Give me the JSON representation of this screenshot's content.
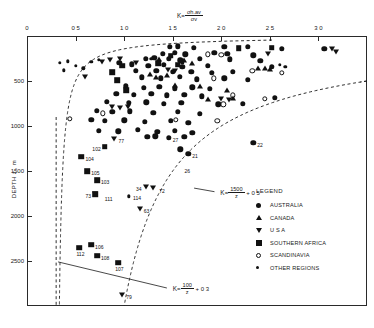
{
  "chart_data": {
    "type": "scatter",
    "title": "",
    "xlabel": "K = sigma_h,av / sigma_v",
    "xlabel_parts": {
      "k": "K",
      "sub": "",
      "num": "σₕ.ₐᵥ",
      "den": "σᵥ"
    },
    "ylabel": "DEPTH z , m",
    "xlim": [
      0,
      3.5
    ],
    "ylim": [
      0,
      3000
    ],
    "y_inverted": true,
    "xticks": [
      0,
      0.5,
      1.0,
      1.5,
      2.0,
      2.5,
      3.0
    ],
    "xticklabels": [
      "0",
      "0 5",
      "1 0",
      "1 5",
      "2 0",
      "2 5",
      "3 0"
    ],
    "yticks": [
      500,
      1000,
      1500,
      2000,
      2500
    ],
    "yticklabels": [
      "500",
      "1000",
      "1500",
      "2000",
      "2500"
    ],
    "grid": false,
    "legend_position": "right-center",
    "annotations": [
      {
        "id": "upper-bound-eq",
        "text": "K = 1500/z + 0.5",
        "k_symbol": "K",
        "numerator": "1500",
        "denominator": "z",
        "constant": "+ 0 5",
        "x": 1.97,
        "y": 1740
      },
      {
        "id": "lower-bound-eq",
        "text": "K = 100/z + 0.3",
        "k_symbol": "K",
        "numerator": "100",
        "denominator": "z",
        "constant": "+ 0 3",
        "x": 1.48,
        "y": 2810
      }
    ],
    "bound_curves": [
      {
        "name": "lower-bound",
        "equation": "K = 100/z + 0.3",
        "style": "dashed",
        "asymptote_k": 0.3
      },
      {
        "name": "upper-bound",
        "equation": "K = 1500/z + 0.5",
        "style": "dashed",
        "asymptote_k": 0.5
      }
    ],
    "series": [
      {
        "name": "AUSTRALIA",
        "symbol": "filled-circle",
        "color": "#111111",
        "points": [
          [
            1.47,
            120
          ],
          [
            1.55,
            115
          ],
          [
            1.72,
            130
          ],
          [
            2.03,
            120
          ],
          [
            2.27,
            120
          ],
          [
            2.62,
            145
          ],
          [
            3.06,
            140
          ],
          [
            1.4,
            200
          ],
          [
            1.52,
            190
          ],
          [
            1.63,
            205
          ],
          [
            1.93,
            185
          ],
          [
            2.06,
            195
          ],
          [
            2.33,
            215
          ],
          [
            1.22,
            250
          ],
          [
            1.31,
            245
          ],
          [
            1.46,
            255
          ],
          [
            1.58,
            270
          ],
          [
            1.78,
            250
          ],
          [
            2.09,
            260
          ],
          [
            2.4,
            275
          ],
          [
            0.95,
            300
          ],
          [
            1.08,
            315
          ],
          [
            1.25,
            330
          ],
          [
            1.41,
            320
          ],
          [
            1.6,
            340
          ],
          [
            1.86,
            330
          ],
          [
            2.52,
            345
          ],
          [
            1.12,
            390
          ],
          [
            1.33,
            385
          ],
          [
            1.5,
            400
          ],
          [
            1.69,
            395
          ],
          [
            1.9,
            410
          ],
          [
            2.12,
            400
          ],
          [
            1.18,
            460
          ],
          [
            1.38,
            470
          ],
          [
            1.57,
            455
          ],
          [
            1.75,
            480
          ],
          [
            2.03,
            470
          ],
          [
            2.27,
            490
          ],
          [
            1.02,
            560
          ],
          [
            1.2,
            575
          ],
          [
            1.36,
            565
          ],
          [
            1.52,
            580
          ],
          [
            1.7,
            570
          ],
          [
            1.88,
            590
          ],
          [
            0.92,
            640
          ],
          [
            1.1,
            655
          ],
          [
            1.28,
            645
          ],
          [
            1.44,
            660
          ],
          [
            1.62,
            650
          ],
          [
            1.8,
            670
          ],
          [
            2.55,
            690
          ],
          [
            0.82,
            730
          ],
          [
            1.05,
            745
          ],
          [
            1.23,
            735
          ],
          [
            1.41,
            755
          ],
          [
            1.59,
            740
          ],
          [
            1.97,
            760
          ],
          [
            2.22,
            750
          ],
          [
            0.72,
            830
          ],
          [
            0.88,
            845
          ],
          [
            1.06,
            835
          ],
          [
            1.3,
            855
          ],
          [
            1.55,
            845
          ],
          [
            1.78,
            865
          ],
          [
            0.66,
            930
          ],
          [
            0.8,
            945
          ],
          [
            1.0,
            935
          ],
          [
            1.21,
            955
          ],
          [
            1.48,
            945
          ],
          [
            1.66,
            965
          ],
          [
            0.74,
            1050
          ],
          [
            0.94,
            1060
          ],
          [
            1.14,
            1045
          ],
          [
            1.34,
            1065
          ],
          [
            1.52,
            1055
          ],
          [
            1.7,
            1075
          ],
          [
            1.24,
            1120
          ],
          [
            1.32,
            1115
          ],
          [
            1.46,
            1130
          ],
          [
            1.62,
            1120
          ],
          [
            2.33,
            1190
          ],
          [
            1.58,
            1260
          ],
          [
            1.66,
            1310
          ]
        ]
      },
      {
        "name": "CANADA",
        "symbol": "triangle-up",
        "color": "#111111",
        "points": [
          [
            1.36,
            250
          ],
          [
            1.62,
            265
          ],
          [
            1.7,
            300
          ],
          [
            1.27,
            420
          ],
          [
            1.44,
            430
          ],
          [
            1.33,
            455
          ],
          [
            1.52,
            540
          ],
          [
            1.78,
            560
          ],
          [
            2.06,
            600
          ],
          [
            2.38,
            360
          ],
          [
            2.45,
            355
          ],
          [
            2.5,
            370
          ],
          [
            2.12,
            690
          ],
          [
            1.86,
            700
          ]
        ]
      },
      {
        "name": "U S A",
        "symbol": "triangle-down",
        "color": "#111111",
        "points": [
          [
            0.6,
            460
          ],
          [
            0.77,
            290
          ],
          [
            0.85,
            270
          ],
          [
            0.96,
            255
          ],
          [
            1.12,
            300
          ],
          [
            1.45,
            380
          ],
          [
            1.52,
            385
          ],
          [
            2.0,
            700
          ],
          [
            2.08,
            710
          ],
          [
            3.14,
            145
          ],
          [
            3.18,
            180
          ],
          [
            2.48,
            205
          ],
          [
            0.88,
            790
          ],
          [
            0.96,
            800
          ],
          [
            1.04,
            785
          ],
          [
            0.9,
            1140
          ],
          [
            0.7,
            1760
          ],
          [
            1.22,
            1680
          ],
          [
            1.3,
            1690
          ],
          [
            1.16,
            1920
          ],
          [
            0.98,
            2880
          ]
        ]
      },
      {
        "name": "SOUTHERN AFRICA",
        "symbol": "filled-square",
        "color": "#111111",
        "points": [
          [
            1.48,
            220
          ],
          [
            1.35,
            300
          ],
          [
            1.55,
            320
          ],
          [
            0.98,
            330
          ],
          [
            0.88,
            400
          ],
          [
            0.93,
            490
          ],
          [
            2.18,
            135
          ],
          [
            2.52,
            130
          ],
          [
            1.02,
            600
          ],
          [
            0.8,
            1230
          ],
          [
            0.56,
            1340
          ],
          [
            0.62,
            1500
          ],
          [
            0.72,
            1600
          ],
          [
            0.7,
            1760
          ],
          [
            0.54,
            2350
          ],
          [
            0.66,
            2320
          ],
          [
            0.72,
            2440
          ],
          [
            0.94,
            2520
          ]
        ]
      },
      {
        "name": "SCANDINAVIA",
        "symbol": "open-circle",
        "color": "#111111",
        "points": [
          [
            1.86,
            205
          ],
          [
            2.0,
            210
          ],
          [
            2.32,
            390
          ],
          [
            2.62,
            410
          ],
          [
            1.92,
            470
          ],
          [
            0.44,
            920
          ],
          [
            0.78,
            860
          ],
          [
            2.12,
            660
          ],
          [
            2.45,
            700
          ],
          [
            1.53,
            930
          ],
          [
            1.96,
            945
          ],
          [
            2.02,
            760
          ]
        ]
      },
      {
        "name": "OTHER REGIONS",
        "symbol": "small-dot",
        "color": "#111111",
        "points": [
          [
            0.34,
            300
          ],
          [
            0.42,
            280
          ],
          [
            0.5,
            330
          ],
          [
            0.58,
            360
          ],
          [
            0.66,
            285
          ],
          [
            0.74,
            265
          ],
          [
            0.38,
            380
          ],
          [
            1.28,
            255
          ],
          [
            1.6,
            300
          ],
          [
            2.6,
            320
          ],
          [
            2.66,
            345
          ],
          [
            1.05,
            1780
          ]
        ]
      }
    ],
    "labeled_points": [
      {
        "label": "102",
        "x": 0.8,
        "y": 1230,
        "symbol": "filled-square",
        "label_side": "left"
      },
      {
        "label": "104",
        "x": 0.56,
        "y": 1340,
        "symbol": "filled-square",
        "label_side": "right"
      },
      {
        "label": "105",
        "x": 0.62,
        "y": 1500,
        "symbol": "filled-square",
        "label_side": "right"
      },
      {
        "label": "103",
        "x": 0.72,
        "y": 1600,
        "symbol": "filled-square",
        "label_side": "right"
      },
      {
        "label": "73",
        "x": 0.7,
        "y": 1760,
        "symbol": "triangle-down",
        "label_side": "left"
      },
      {
        "label": "111",
        "x": 0.76,
        "y": 1790,
        "symbol": "filled-square",
        "label_side": "right"
      },
      {
        "label": "112",
        "x": 0.54,
        "y": 2350,
        "symbol": "filled-square",
        "label_side": "below"
      },
      {
        "label": "106",
        "x": 0.66,
        "y": 2320,
        "symbol": "filled-square",
        "label_side": "right"
      },
      {
        "label": "108",
        "x": 0.72,
        "y": 2440,
        "symbol": "filled-square",
        "label_side": "right"
      },
      {
        "label": "107",
        "x": 0.94,
        "y": 2520,
        "symbol": "filled-square",
        "label_side": "below"
      },
      {
        "label": "79",
        "x": 0.98,
        "y": 2880,
        "symbol": "triangle-down",
        "label_side": "right"
      },
      {
        "label": "77",
        "x": 0.9,
        "y": 1140,
        "symbol": "triangle-down",
        "label_side": "right"
      },
      {
        "label": "27",
        "x": 1.46,
        "y": 1130,
        "symbol": "filled-circle",
        "label_side": "right"
      },
      {
        "label": "21",
        "x": 1.66,
        "y": 1310,
        "symbol": "filled-circle",
        "label_side": "right"
      },
      {
        "label": "26",
        "x": 1.58,
        "y": 1480,
        "symbol": "filled-circle",
        "label_side": "right"
      },
      {
        "label": "22",
        "x": 2.33,
        "y": 1190,
        "symbol": "filled-circle",
        "label_side": "right"
      },
      {
        "label": "34",
        "x": 1.22,
        "y": 1680,
        "symbol": "triangle-down",
        "label_side": "left"
      },
      {
        "label": "72",
        "x": 1.32,
        "y": 1700,
        "symbol": "triangle-down",
        "label_side": "right"
      },
      {
        "label": "114",
        "x": 1.05,
        "y": 1780,
        "symbol": "small-dot",
        "label_side": "right"
      },
      {
        "label": "63",
        "x": 1.16,
        "y": 1920,
        "symbol": "triangle-down",
        "label_side": "right"
      }
    ]
  },
  "legend": {
    "title": "LEGEND",
    "items": [
      {
        "label": "AUSTRALIA",
        "symbol": "filled-circle"
      },
      {
        "label": "CANADA",
        "symbol": "triangle-up"
      },
      {
        "label": "U S A",
        "symbol": "triangle-down"
      },
      {
        "label": "SOUTHERN AFRICA",
        "symbol": "filled-square"
      },
      {
        "label": "SCANDINAVIA",
        "symbol": "open-circle"
      },
      {
        "label": "OTHER REGIONS",
        "symbol": "small-dot"
      }
    ]
  },
  "axes": {
    "x_title_k": "K",
    "x_title_num": "σh.av",
    "x_title_den": "σv",
    "y_title": "DEPTH z , m"
  }
}
